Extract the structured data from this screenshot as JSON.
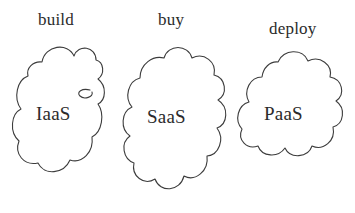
{
  "diagram": {
    "background_color": "#ffffff",
    "stroke_color": "#3c3c3c",
    "text_color": "#2b2b2b",
    "style": "hand-drawn outline clouds",
    "clouds": [
      {
        "id": "iaas",
        "top_label": "build",
        "inner_label": "IaaS",
        "shape": "cloud",
        "position": "left"
      },
      {
        "id": "saas",
        "top_label": "buy",
        "inner_label": "SaaS",
        "shape": "cloud",
        "position": "center"
      },
      {
        "id": "paas",
        "top_label": "deploy",
        "inner_label": "PaaS",
        "shape": "cloud",
        "position": "right"
      }
    ]
  }
}
